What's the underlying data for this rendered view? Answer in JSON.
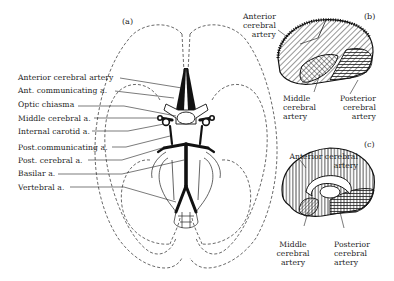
{
  "figure": {
    "panels": {
      "a": "(a)",
      "b": "(b)",
      "c": "(c)"
    },
    "panel_a": {
      "title": "Base of brain — circle of Willis",
      "labels": [
        "Anterior cerebral artery",
        "Ant. communicating a.",
        "Optic chiasma",
        "Middle cerebral a.",
        "Internal carotid a.",
        "Post.communicating a.",
        "Post. cerebral a.",
        "Basilar a.",
        "Vertebral a."
      ]
    },
    "panel_b": {
      "title": "Lateral view of cerebral hemisphere",
      "labels": {
        "anterior": [
          "Anterior",
          "cerebral",
          "artery"
        ],
        "middle": [
          "Middle",
          "cerebral",
          "artery"
        ],
        "posterior": [
          "Posterior",
          "cerebral",
          "artery"
        ]
      }
    },
    "panel_c": {
      "title": "Medial view of cerebral hemisphere",
      "labels": {
        "anterior": [
          "Anterior cerebral",
          "artery"
        ],
        "middle": [
          "Middle",
          "cerebral",
          "artery"
        ],
        "posterior": [
          "Posterior",
          "cerebral",
          "artery"
        ]
      }
    },
    "colors": {
      "ink": "#1a1a1a",
      "background": "#ffffff"
    }
  }
}
